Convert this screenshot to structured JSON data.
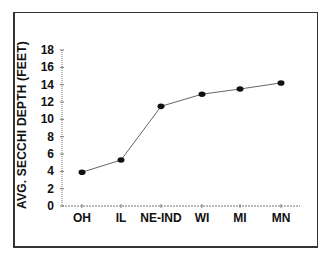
{
  "chart_data": {
    "type": "line",
    "title": "",
    "xlabel": "",
    "ylabel": "AVG. SECCHI DEPTH (FEET)",
    "categories": [
      "OH",
      "IL",
      "NE-IND",
      "WI",
      "MI",
      "MN"
    ],
    "values": [
      3.9,
      5.3,
      11.5,
      12.9,
      13.5,
      14.2
    ],
    "ylim": [
      0,
      18
    ],
    "yticks": [
      0,
      2,
      4,
      6,
      8,
      10,
      12,
      14,
      16,
      18
    ],
    "grid": false,
    "legend": null,
    "marker": "filled-circle",
    "line_color": "#666666",
    "marker_color": "#111111"
  }
}
